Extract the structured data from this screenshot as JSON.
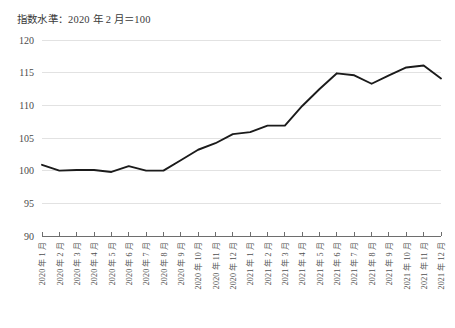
{
  "chart_data": {
    "type": "line",
    "title": "指数水準：2020 年 2 月＝100",
    "xlabel": "",
    "ylabel": "",
    "ylim": [
      90,
      120
    ],
    "yticks": [
      90,
      95,
      100,
      105,
      110,
      115,
      120
    ],
    "ytick_labels": [
      "90",
      "95",
      "100",
      "105",
      "110",
      "115",
      "120"
    ],
    "grid": true,
    "legend": "none",
    "line_color": "#1b1b1b",
    "grid_color": "#e2e2e2",
    "axis_color": "#6e6e6e",
    "categories": [
      "2020 年 1 月",
      "2020 年 2 月",
      "2020 年 3 月",
      "2020 年 4 月",
      "2020 年 5 月",
      "2020 年 6 月",
      "2020 年 7 月",
      "2020 年 8 月",
      "2020 年 9 月",
      "2020 年 10 月",
      "2020 年 11 月",
      "2020 年 12 月",
      "2021 年 1 月",
      "2021 年 2 月",
      "2021 年 3 月",
      "2021 年 4 月",
      "2021 年 5 月",
      "2021 年 6 月",
      "2021 年 7 月",
      "2021 年 8 月",
      "2021 年 9 月",
      "2021 年 10 月",
      "2021 年 11 月",
      "2021 年 12 月"
    ],
    "series": [
      {
        "name": "指数水準",
        "values": [
          100.9,
          100.0,
          100.1,
          100.1,
          99.8,
          100.7,
          100.0,
          100.0,
          101.6,
          103.2,
          104.2,
          105.6,
          105.9,
          106.9,
          106.9,
          109.9,
          112.5,
          114.9,
          114.6,
          113.3,
          114.6,
          115.8,
          116.1,
          114.1
        ]
      }
    ]
  }
}
